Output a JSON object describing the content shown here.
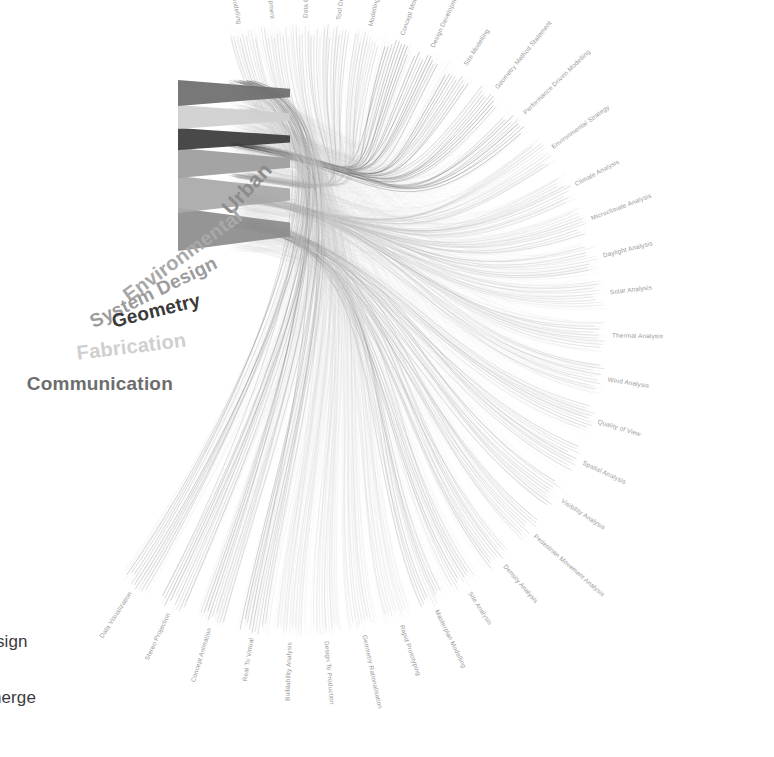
{
  "figure": {
    "type": "radial-chord-diagram",
    "title_visible": false,
    "background": "#ffffff",
    "center": {
      "x": 300,
      "y": 330
    },
    "hub_radius": 38,
    "ring_radius": 300,
    "label_radius": 312
  },
  "categories": [
    {
      "id": "urban",
      "label": "Urban",
      "color": "#8c8c8c",
      "font_size": 21,
      "angle_deg": -54,
      "label_x": 268,
      "label_y": 166,
      "label_rot": -47,
      "stub_from": 251,
      "stub_to": 208,
      "weight": 0.62
    },
    {
      "id": "environmental",
      "label": "Environmental",
      "color": "#a8a8a8",
      "font_size": 20,
      "angle_deg": -36,
      "label_x": 240,
      "label_y": 214,
      "label_rot": -36,
      "stub_from": 213,
      "stub_to": 176,
      "weight": 0.78
    },
    {
      "id": "system-design",
      "label": "System Design",
      "color": "#9c9c9c",
      "font_size": 19,
      "angle_deg": -20,
      "label_x": 216,
      "label_y": 262,
      "label_rot": -26,
      "stub_from": 178,
      "stub_to": 148,
      "weight": 0.7
    },
    {
      "id": "geometry",
      "label": "Geometry",
      "color": "#3a3a3a",
      "font_size": 19,
      "angle_deg": -4,
      "label_x": 200,
      "label_y": 300,
      "label_rot": -14,
      "stub_from": 150,
      "stub_to": 128,
      "weight": 0.95
    },
    {
      "id": "fabrication",
      "label": "Fabrication",
      "color": "#cfcfcf",
      "font_size": 20,
      "angle_deg": 14,
      "label_x": 186,
      "label_y": 340,
      "label_rot": -7,
      "stub_from": 129,
      "stub_to": 105,
      "weight": 0.52
    },
    {
      "id": "communication",
      "label": "Communication",
      "color": "#6d6d6d",
      "font_size": 19,
      "angle_deg": 30,
      "label_x": 173,
      "label_y": 384,
      "label_rot": 0,
      "stub_from": 106,
      "stub_to": 80,
      "weight": 0.6
    }
  ],
  "ring_labels": [
    {
      "label": "Building Information Modelling",
      "category": "system-design",
      "angle_deg": -101
    },
    {
      "label": "Workflow Development",
      "category": "system-design",
      "angle_deg": -95
    },
    {
      "label": "Data Conversion",
      "category": "system-design",
      "angle_deg": -89
    },
    {
      "label": "Tool Development",
      "category": "system-design",
      "angle_deg": -83
    },
    {
      "label": "Modelling Strategy",
      "category": "system-design",
      "angle_deg": -77
    },
    {
      "label": "Concept Modelling",
      "category": "geometry",
      "angle_deg": -71
    },
    {
      "label": "Design Development Modelling",
      "category": "geometry",
      "angle_deg": -65
    },
    {
      "label": "Site Modelling",
      "category": "geometry",
      "angle_deg": -58
    },
    {
      "label": "Geometry Method Statement",
      "category": "geometry",
      "angle_deg": -51
    },
    {
      "label": "Performance Driven Modelling",
      "category": "geometry",
      "angle_deg": -44
    },
    {
      "label": "Environmental Strategy",
      "category": "environmental",
      "angle_deg": -36
    },
    {
      "label": "Climate Analysis",
      "category": "environmental",
      "angle_deg": -28
    },
    {
      "label": "Microclimate Analysis",
      "category": "environmental",
      "angle_deg": -21
    },
    {
      "label": "Daylight Analysis",
      "category": "environmental",
      "angle_deg": -14
    },
    {
      "label": "Solar Analysis",
      "category": "environmental",
      "angle_deg": -7
    },
    {
      "label": "Thermal Analysis",
      "category": "environmental",
      "angle_deg": 1
    },
    {
      "label": "Wind Analysis",
      "category": "environmental",
      "angle_deg": 9
    },
    {
      "label": "Quality of View",
      "category": "urban",
      "angle_deg": 17
    },
    {
      "label": "Spatial Analysis",
      "category": "urban",
      "angle_deg": 25
    },
    {
      "label": "Visibility Analysis",
      "category": "urban",
      "angle_deg": 33
    },
    {
      "label": "Pedestrian Movement Analysis",
      "category": "urban",
      "angle_deg": 41
    },
    {
      "label": "Density Analysis",
      "category": "urban",
      "angle_deg": 49
    },
    {
      "label": "Site Analysis",
      "category": "urban",
      "angle_deg": 57
    },
    {
      "label": "Masterplan Modelling",
      "category": "urban",
      "angle_deg": 64
    },
    {
      "label": "Rapid Prototyping",
      "category": "fabrication",
      "angle_deg": 71
    },
    {
      "label": "Geometry Rationalisation",
      "category": "fabrication",
      "angle_deg": 78
    },
    {
      "label": "Design To Production",
      "category": "fabrication",
      "angle_deg": 85
    },
    {
      "label": "Buildability Analysis",
      "category": "fabrication",
      "angle_deg": 92
    },
    {
      "label": "Real To Virtual",
      "category": "communication",
      "angle_deg": 99
    },
    {
      "label": "Concept Animation",
      "category": "communication",
      "angle_deg": 107
    },
    {
      "label": "Stereo Projection",
      "category": "communication",
      "angle_deg": 115
    },
    {
      "label": "Data Visualization",
      "category": "communication",
      "angle_deg": 123
    }
  ],
  "caption_fragments": [
    {
      "text": "sign",
      "x": -4,
      "y": 632
    },
    {
      "text": "nerge",
      "x": -8,
      "y": 688
    }
  ],
  "colors": {
    "ribbon_light": "#d8d8d8",
    "ribbon_mid": "#b4b4b4",
    "ribbon_dark": "#6a6a6a",
    "thread": "#c9c9c9",
    "leaf_text": "#9a9a9a"
  }
}
